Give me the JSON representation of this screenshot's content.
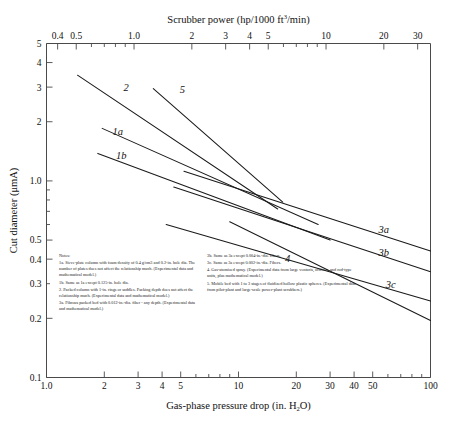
{
  "chart_data": {
    "type": "line",
    "title": "",
    "xlabel": "Gas-phase pressure drop (in. H2O)",
    "ylabel": "Cut diameter (μmA)",
    "top_axis_label": "Scrubber power (hp/1000 ft3/min)",
    "xscale": "log",
    "yscale": "log",
    "xlim": [
      1.0,
      100
    ],
    "ylim": [
      0.1,
      5
    ],
    "top_xlim": [
      0.35,
      35
    ],
    "grid": false,
    "legend": "inline-curve-labels",
    "x_ticks": [
      "1.0",
      "2",
      "3",
      "4",
      "5",
      "10",
      "20",
      "30",
      "40",
      "50",
      "100"
    ],
    "x_tick_values": [
      1.0,
      2,
      3,
      4,
      5,
      10,
      20,
      30,
      40,
      50,
      100
    ],
    "y_ticks": [
      "5",
      "4",
      "3",
      "2",
      "1.0",
      "0.5",
      "0.4",
      "0.3",
      "0.2",
      "0.1"
    ],
    "y_tick_values": [
      5,
      4,
      3,
      2,
      1.0,
      0.5,
      0.4,
      0.3,
      0.2,
      0.1
    ],
    "top_ticks": [
      "0.4",
      "0.5",
      "1.0",
      "2",
      "3",
      "4",
      "5",
      "10",
      "20",
      "30"
    ],
    "top_tick_values": [
      0.4,
      0.5,
      1.0,
      2,
      3,
      4,
      5,
      10,
      20,
      30
    ],
    "series": [
      {
        "name": "2",
        "label": "2",
        "points": [
          [
            1.45,
            3.45
          ],
          [
            16.0,
            0.72
          ]
        ]
      },
      {
        "name": "1a",
        "label": "1a",
        "points": [
          [
            1.95,
            1.85
          ],
          [
            26.0,
            0.6
          ]
        ]
      },
      {
        "name": "1b",
        "label": "1b",
        "points": [
          [
            1.85,
            1.38
          ],
          [
            30.0,
            0.5
          ]
        ]
      },
      {
        "name": "5",
        "label": "5",
        "points": [
          [
            3.6,
            2.95
          ],
          [
            17.0,
            0.78
          ]
        ]
      },
      {
        "name": "3a",
        "label": "3a",
        "points": [
          [
            5.2,
            1.12
          ],
          [
            100.0,
            0.44
          ]
        ]
      },
      {
        "name": "3b",
        "label": "3b",
        "points": [
          [
            4.6,
            0.93
          ],
          [
            100.0,
            0.345
          ]
        ]
      },
      {
        "name": "3c",
        "label": "3c",
        "points": [
          [
            4.2,
            0.6
          ],
          [
            100.0,
            0.245
          ]
        ]
      },
      {
        "name": "4",
        "label": "4",
        "points": [
          [
            9.0,
            0.62
          ],
          [
            100.0,
            0.195
          ]
        ]
      }
    ],
    "annotations": [
      {
        "text": "2",
        "x": 2.6,
        "y": 2.85
      },
      {
        "text": "1a",
        "x": 2.35,
        "y": 1.72
      },
      {
        "text": "1b",
        "x": 2.45,
        "y": 1.3
      },
      {
        "text": "5",
        "x": 5.1,
        "y": 2.8
      },
      {
        "text": "3a",
        "x": 57.0,
        "y": 0.545
      },
      {
        "text": "3b",
        "x": 57.0,
        "y": 0.415
      },
      {
        "text": "3c",
        "x": 62.0,
        "y": 0.285
      },
      {
        "text": "4",
        "x": 18.0,
        "y": 0.385
      }
    ]
  },
  "axes": {
    "top_title_main": "Scrubber power (hp/1000 ft",
    "top_title_sup": "3",
    "top_title_tail": "/min)",
    "bottom_title_main": "Gas-phase pressure drop (in. H",
    "bottom_title_sub": "2",
    "bottom_title_tail": "O)",
    "y_title": "Cut diameter (μmA)"
  },
  "notes": {
    "heading": "Notes:",
    "left": [
      "1a. Sieve-plate column with foam density of 0.4 g/cm3 and 0.2-in. hole dia. The number of plates does not affect the relationship much. (Experimental data and mathematical model.)",
      "1b. Same as 1a except 0.125-in. hole dia.",
      "2. Packed column with 1-in. rings or saddles. Packing depth does not affect the relationship much. (Experimental data and mathematical model.)",
      "3a. Fibrous packed bed with 0.012-in.-dia. fiber - any depth. (Experimental data and mathematical model.)"
    ],
    "right": [
      "3b. Same as 3a except 0.004-in.-dia. fibers.",
      "3c. Same as 3a except 0.002-in.-dia. Fibers.",
      "4. Gas-atomized spray. (Experimental data from large venturis, orifices, and rod-type units, plus mathematical model.)",
      "5. Mobile bed with 1 to 3 stages of fluidized hollow plastic spheres. (Experimental data from pilot-plant and large-scale power-plant scrubbers.)"
    ]
  }
}
